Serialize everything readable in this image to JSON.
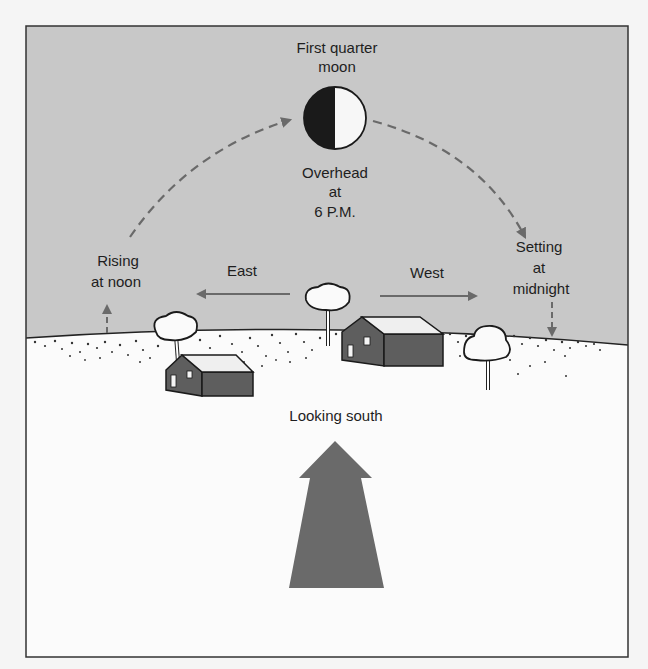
{
  "diagram": {
    "title": "First quarter moon",
    "moon": {
      "phase": "first-quarter",
      "label_line1": "First quarter",
      "label_line2": "moon",
      "position_line1": "Overhead",
      "position_line2": "at",
      "position_line3": "6 P.M."
    },
    "rising": {
      "line1": "Rising",
      "line2": "at noon"
    },
    "setting": {
      "line1": "Setting",
      "line2": "at",
      "line3": "midnight"
    },
    "directions": {
      "east": "East",
      "west": "West"
    },
    "viewer": {
      "label": "Looking south"
    },
    "colors": {
      "sky": "#c8c8c8",
      "ground": "#fbfbfb",
      "arrow": "#6a6a6a",
      "house": "#5e5e5e",
      "roof": "#efefef",
      "frame": "#333333",
      "moon_dark": "#1a1a1a",
      "moon_light": "#f7f7f7"
    }
  }
}
